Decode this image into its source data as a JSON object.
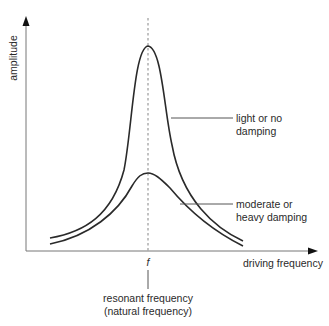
{
  "axes": {
    "y_label": "amplitude",
    "x_label": "driving frequency"
  },
  "resonance": {
    "marker": "f",
    "label_line1": "resonant frequency",
    "label_line2": "(natural frequency)"
  },
  "curves": [
    {
      "id": "light",
      "label_line1": "light or no",
      "label_line2": "damping"
    },
    {
      "id": "heavy",
      "label_line1": "moderate or",
      "label_line2": "heavy damping"
    }
  ],
  "colors": {
    "axis": "#555555",
    "curve": "#2a2a2a",
    "dashed": "#999999",
    "text": "#2a2a2a"
  }
}
